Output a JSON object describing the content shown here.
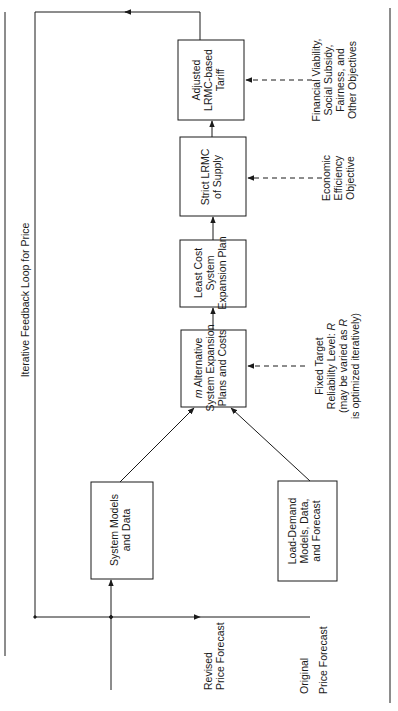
{
  "diagram": {
    "orientation": "rotated 90 degrees counter-clockwise",
    "loop_label": "Iterative Feedback Loop for Price",
    "inputs": {
      "revised": [
        "Revised",
        "Price Forecast"
      ],
      "original": [
        "Original",
        "Price Forecast"
      ]
    },
    "boxes": {
      "system_models": [
        "System Models",
        "and Data"
      ],
      "load_demand": [
        "Load-Demand",
        "Models, Data,",
        "and Forecast"
      ],
      "alternatives": [
        "m Alternative",
        "System Expansion",
        "Plans and Costs"
      ],
      "least_cost": [
        "Least Cost",
        "System",
        "Expansion Plan"
      ],
      "strict_lrmc": [
        "Strict LRMC",
        "of Supply"
      ],
      "adjusted_tariff": [
        "Adjusted",
        "LRMC-based",
        "Tariff"
      ]
    },
    "side_inputs": {
      "reliability": [
        "Fixed Target",
        "Reliability Level: R",
        "(may be varied as R",
        "is optimized iteratively)"
      ],
      "efficiency": [
        "Economic",
        "Efficiency",
        "Objective"
      ],
      "financial": [
        "Financial Viability,",
        "Social Subsidy,",
        "Fairness, and",
        "Other Objectives"
      ]
    },
    "colors": {
      "line": "#1a1a1a",
      "background": "#ffffff"
    }
  }
}
